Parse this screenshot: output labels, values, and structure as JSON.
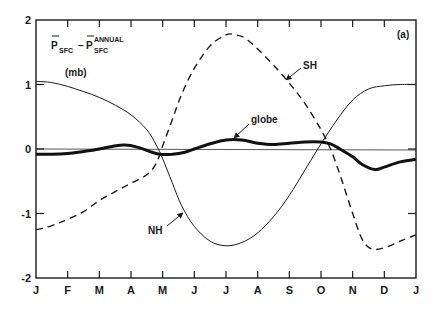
{
  "chart_data": {
    "type": "line",
    "panel_label": "(a)",
    "ylabel_main": "P",
    "ylabel_sub": "SFC",
    "ylabel_minus": "−",
    "ylabel_sup": "ANNUAL",
    "ylabel_units": "(mb)",
    "xlabel": "",
    "ylim": [
      -2,
      2
    ],
    "yticks": [
      -2,
      -1,
      0,
      1,
      2
    ],
    "ytick_labels": [
      "-2",
      "-1",
      "0",
      "1",
      "2"
    ],
    "categories": [
      "J",
      "F",
      "M",
      "A",
      "M",
      "J",
      "J",
      "A",
      "S",
      "O",
      "N",
      "D",
      "J"
    ],
    "grid": false,
    "zero_line": true,
    "series": [
      {
        "name": "NH",
        "style": "solid-thin",
        "x": [
          0,
          0.5,
          1,
          1.5,
          2,
          2.5,
          3,
          3.5,
          3.8,
          4,
          4.3,
          4.6,
          5,
          5.5,
          6,
          6.5,
          7,
          7.5,
          8,
          8.5,
          9,
          9.5,
          10,
          10.5,
          11,
          11.5,
          12
        ],
        "values": [
          1.05,
          1.03,
          0.97,
          0.89,
          0.8,
          0.68,
          0.53,
          0.3,
          0.06,
          -0.15,
          -0.52,
          -0.88,
          -1.2,
          -1.43,
          -1.5,
          -1.45,
          -1.3,
          -1.05,
          -0.72,
          -0.32,
          0.08,
          0.45,
          0.76,
          0.93,
          0.98,
          1.0,
          1.0
        ]
      },
      {
        "name": "SH",
        "style": "dashed",
        "x": [
          0,
          0.3,
          0.7,
          1,
          1.5,
          2,
          2.5,
          3,
          3.5,
          3.8,
          4,
          4.3,
          4.6,
          5,
          5.5,
          6,
          6.3,
          6.6,
          7,
          7.5,
          8,
          8.5,
          9,
          9.3,
          9.6,
          10,
          10.3,
          10.6,
          11,
          11.5,
          12
        ],
        "values": [
          -1.25,
          -1.22,
          -1.15,
          -1.09,
          -0.97,
          -0.8,
          -0.66,
          -0.53,
          -0.4,
          -0.22,
          0.05,
          0.45,
          0.85,
          1.25,
          1.6,
          1.77,
          1.77,
          1.72,
          1.55,
          1.3,
          1.02,
          0.7,
          0.3,
          0.0,
          -0.4,
          -1.0,
          -1.4,
          -1.55,
          -1.53,
          -1.43,
          -1.33
        ]
      },
      {
        "name": "globe",
        "style": "solid-thick",
        "x": [
          0,
          0.5,
          1,
          1.5,
          2,
          2.4,
          2.8,
          3.2,
          3.6,
          3.9,
          4.3,
          4.7,
          5,
          5.5,
          6,
          6.5,
          7,
          7.5,
          8,
          8.5,
          9,
          9.3,
          9.6,
          10,
          10.3,
          10.7,
          11,
          11.5,
          12
        ],
        "values": [
          -0.08,
          -0.08,
          -0.07,
          -0.04,
          0.0,
          0.04,
          0.06,
          0.03,
          -0.04,
          -0.08,
          -0.08,
          -0.05,
          0.0,
          0.08,
          0.14,
          0.14,
          0.09,
          0.07,
          0.09,
          0.11,
          0.11,
          0.08,
          0.0,
          -0.12,
          -0.24,
          -0.32,
          -0.28,
          -0.2,
          -0.16
        ]
      }
    ],
    "annotations": [
      {
        "text": "NH",
        "x_px": 148,
        "y_px": 234,
        "arrow_from": [
          167,
          226
        ],
        "arrow_to": [
          183,
          213
        ]
      },
      {
        "text": "SH",
        "x_px": 303,
        "y_px": 69,
        "arrow_from": [
          301,
          68
        ],
        "arrow_to": [
          286,
          80
        ]
      },
      {
        "text": "globe",
        "x_px": 251,
        "y_px": 123,
        "arrow_from": [
          249,
          124
        ],
        "arrow_to": [
          234,
          138
        ]
      }
    ]
  }
}
